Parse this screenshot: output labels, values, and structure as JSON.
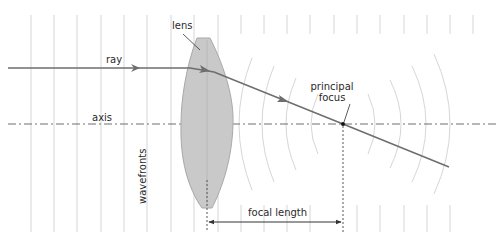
{
  "diagram": {
    "type": "converging-lens-ray-diagram",
    "labels": {
      "lens": "lens",
      "ray": "ray",
      "axis": "axis",
      "principal_focus_line1": "principal",
      "principal_focus_line2": "focus",
      "wavefronts": "wavefronts",
      "focal_length": "focal length"
    },
    "colors": {
      "ray": "#6e6e6e",
      "lens_fill": "#c9c9c9",
      "lens_stroke": "#a0a0a0",
      "wavefront": "#d6d6d6",
      "axis": "#6e6e6e",
      "focus_point": "#111111",
      "text": "#2a2a2a"
    }
  }
}
